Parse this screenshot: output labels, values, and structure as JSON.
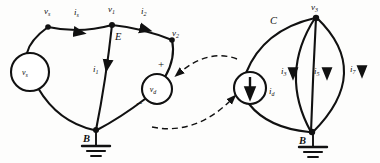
{
  "figure": {
    "type": "circuit-diagram",
    "background_color": "#fdfdfc",
    "line_color": "#111111"
  },
  "left_network": {
    "name": "voltage-source-network",
    "nodes": [
      {
        "id": "vs-node",
        "label": "v",
        "sub": "s",
        "x": 48,
        "y": 24
      },
      {
        "id": "v1-node",
        "label": "v",
        "sub": "1",
        "x": 112,
        "y": 22
      },
      {
        "id": "v2-node",
        "label": "v",
        "sub": "2",
        "x": 172,
        "y": 37
      },
      {
        "id": "b-node",
        "label": "B",
        "sub": "",
        "x": 96,
        "y": 130
      }
    ],
    "sources": [
      {
        "id": "vs-source",
        "kind": "voltage",
        "label": "v",
        "sub": "s",
        "cx": 30,
        "cy": 72,
        "r": 19
      },
      {
        "id": "vd-source",
        "kind": "voltage",
        "label": "v",
        "sub": "d",
        "cx": 157,
        "cy": 89,
        "r": 15,
        "plus": "+",
        "minus": "−"
      }
    ],
    "currents": [
      {
        "id": "is-current",
        "label": "i",
        "sub": "s",
        "x": 78,
        "y": 22
      },
      {
        "id": "i2-current",
        "label": "i",
        "sub": "2",
        "x": 145,
        "y": 20
      },
      {
        "id": "i1-current",
        "label": "i",
        "sub": "1",
        "x": 99,
        "y": 78
      }
    ],
    "region_label": {
      "id": "E-label",
      "text": "E",
      "x": 118,
      "y": 37
    },
    "ground": {
      "id": "left-ground",
      "x": 96,
      "y": 130
    }
  },
  "right_network": {
    "name": "current-source-network",
    "nodes": [
      {
        "id": "v3-node",
        "label": "v",
        "sub": "3",
        "x": 315,
        "y": 14
      },
      {
        "id": "b-node-right",
        "label": "B",
        "sub": "",
        "x": 311,
        "y": 132
      }
    ],
    "sources": [
      {
        "id": "id-source",
        "kind": "current",
        "label": "i",
        "sub": "d",
        "cx": 250,
        "cy": 88,
        "r": 16,
        "arrow": "down"
      }
    ],
    "currents": [
      {
        "id": "i3-current",
        "label": "i",
        "sub": "3",
        "x": 286,
        "y": 76
      },
      {
        "id": "i5-current",
        "label": "i",
        "sub": "5",
        "x": 320,
        "y": 76
      },
      {
        "id": "i7-current",
        "label": "i",
        "sub": "7",
        "x": 355,
        "y": 74
      }
    ],
    "region_label": {
      "id": "C-label",
      "text": "C",
      "x": 275,
      "y": 22
    },
    "ground": {
      "id": "right-ground",
      "x": 313,
      "y": 132
    }
  },
  "mapping_arrows": [
    {
      "id": "map-arrow-upper",
      "from": "current-source-network",
      "to": "vd-source",
      "style": "dashed"
    },
    {
      "id": "map-arrow-lower",
      "from": "left-network-bottom",
      "to": "id-source",
      "style": "dashed"
    }
  ]
}
